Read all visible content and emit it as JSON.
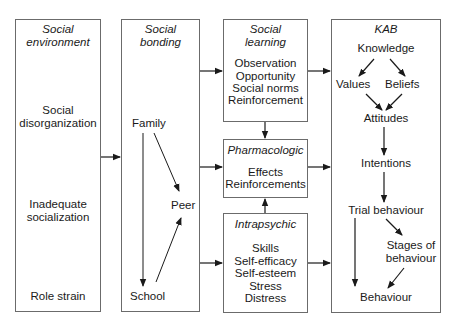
{
  "boxes": {
    "social_environment": {
      "title": [
        "Social",
        "environment"
      ],
      "items": [
        "Social",
        "disorganization",
        "Inadequate",
        "socialization",
        "Role strain"
      ]
    },
    "social_bonding": {
      "title": [
        "Social",
        "bonding"
      ],
      "items": {
        "family": "Family",
        "peer": "Peer",
        "school": "School"
      }
    },
    "social_learning": {
      "title": [
        "Social",
        "learning"
      ],
      "items": [
        "Observation",
        "Opportunity",
        "Social norms",
        "Reinforcement"
      ]
    },
    "pharmacologic": {
      "title": "Pharmacologic",
      "items": [
        "Effects",
        "Reinforcements"
      ]
    },
    "intrapsychic": {
      "title": "Intrapsychic",
      "items": [
        "Skills",
        "Self-efficacy",
        "Self-esteem",
        "Stress",
        "Distress"
      ]
    },
    "kab": {
      "title": "KAB",
      "items": {
        "knowledge": "Knowledge",
        "values": "Values",
        "beliefs": "Beliefs",
        "attitudes": "Attitudes",
        "intentions": "Intentions",
        "trial": "Trial behaviour",
        "stages_1": "Stages of",
        "stages_2": "behaviour",
        "behaviour": "Behaviour"
      }
    }
  },
  "colors": {
    "border": "#6b6b6b",
    "arrow": "#1a1a1a",
    "text": "#1a1a1a"
  }
}
